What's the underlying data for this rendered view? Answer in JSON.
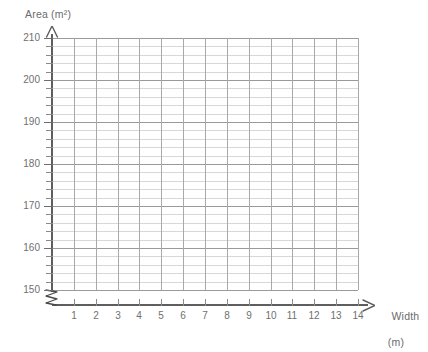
{
  "chart_data": {
    "type": "scatter",
    "title": "",
    "subtitle": "",
    "xlabel": "Width",
    "xlabel_unit": "(m)",
    "ylabel": "Area (m²)",
    "xlim": [
      0,
      14
    ],
    "ylim": [
      150,
      210
    ],
    "y_axis_broken": true,
    "y_break_note": "axis break symbol between origin and 150",
    "grid": true,
    "legend": null,
    "annotations": [],
    "series": [],
    "values": [],
    "x": [],
    "categories": [],
    "x_ticks": [
      1,
      2,
      3,
      4,
      5,
      6,
      7,
      8,
      9,
      10,
      11,
      12,
      13,
      14
    ],
    "x_tick_labels": [
      "1",
      "2",
      "3",
      "4",
      "5",
      "6",
      "7",
      "8",
      "9",
      "10",
      "11",
      "12",
      "13",
      "14"
    ],
    "x_minor_step": 1,
    "y_ticks": [
      150,
      160,
      170,
      180,
      190,
      200,
      210
    ],
    "y_tick_labels": [
      "150",
      "160",
      "170",
      "180",
      "190",
      "200",
      "210"
    ],
    "y_minor_step": 2,
    "y_minor_ticks": [
      150,
      152,
      154,
      156,
      158,
      160,
      162,
      164,
      166,
      168,
      170,
      172,
      174,
      176,
      178,
      180,
      182,
      184,
      186,
      188,
      190,
      192,
      194,
      196,
      198,
      200,
      202,
      204,
      206,
      208,
      210
    ],
    "colors": {
      "background": "#ffffff",
      "axis": "#5e5e5e",
      "gridline_minor": "#d8d8d8",
      "gridline_major": "#9a9a9a",
      "gridline_vertical": "#a9a9a9",
      "tick_label": "#6f6f6f",
      "axis_title": "#6b6b6b"
    }
  }
}
